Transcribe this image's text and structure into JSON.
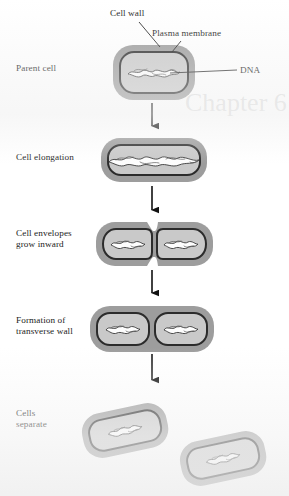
{
  "figure": {
    "type": "process-flow-diagram",
    "orientation": "vertical",
    "background_color": "#ffffff",
    "palette": {
      "cell_wall": "#9d9d9d",
      "plasma_membrane": "#2b2b2b",
      "cytoplasm": "#c9c9c9",
      "dna": "#fdfdfd",
      "dna_outline": "#3a3a3a",
      "text": "#1c1c1c",
      "arrow": "#111111"
    }
  },
  "callouts": [
    {
      "id": "cell-wall",
      "label": "Cell wall",
      "x": 110,
      "y": 8,
      "leader_from": [
        139,
        22
      ],
      "leader_to": [
        160,
        47
      ]
    },
    {
      "id": "plasma-membrane",
      "label": "Plasma membrane",
      "x": 152,
      "y": 28,
      "leader_from": [
        180,
        41
      ],
      "leader_to": [
        172,
        52
      ]
    },
    {
      "id": "dna",
      "label": "DNA",
      "x": 240,
      "y": 67,
      "leader_from": [
        237,
        72
      ],
      "leader_to": [
        176,
        72
      ]
    }
  ],
  "stages": [
    {
      "id": "parent-cell",
      "label": "Parent cell",
      "label_x": 16,
      "label_y": 63,
      "cell_count": 1,
      "description": "Single rod-shaped bacterium with one nucleoid"
    },
    {
      "id": "cell-elongation",
      "label": "Cell elongation",
      "label_x": 16,
      "label_y": 152,
      "cell_count": 1,
      "description": "Cell lengthens and the DNA is replicated into an elongated strand"
    },
    {
      "id": "cell-envelopes-grow-inward",
      "label": "Cell envelopes\ngrow inward",
      "label_x": 16,
      "label_y": 228,
      "cell_count": 1,
      "description": "Wall and membrane pinch inward at midpoint; two nucleoids separate"
    },
    {
      "id": "formation-of-transverse-wall",
      "label": "Formation of\ntransverse wall",
      "label_x": 16,
      "label_y": 315,
      "cell_count": 2,
      "description": "A transverse septum divides the cell into two compartments"
    },
    {
      "id": "cells-separate",
      "label": "Cells\nseparate",
      "label_x": 16,
      "label_y": 408,
      "cell_count": 2,
      "description": "Two independent daughter cells drift apart"
    }
  ],
  "arrows": [
    {
      "id": "arrow-1",
      "from_stage": "parent-cell",
      "to_stage": "cell-elongation",
      "x": 152,
      "y1": 103,
      "y2": 132
    },
    {
      "id": "arrow-2",
      "from_stage": "cell-elongation",
      "to_stage": "cell-envelopes-grow-inward",
      "x": 152,
      "y1": 186,
      "y2": 216
    },
    {
      "id": "arrow-3",
      "from_stage": "cell-envelopes-grow-inward",
      "to_stage": "formation-of-transverse-wall",
      "x": 152,
      "y1": 270,
      "y2": 299
    },
    {
      "id": "arrow-4",
      "from_stage": "formation-of-transverse-wall",
      "to_stage": "cells-separate",
      "x": 152,
      "y1": 354,
      "y2": 386
    }
  ],
  "ghost_text": [
    {
      "text": "Chapter 6",
      "x": 185,
      "y": 88,
      "size": 26
    }
  ]
}
